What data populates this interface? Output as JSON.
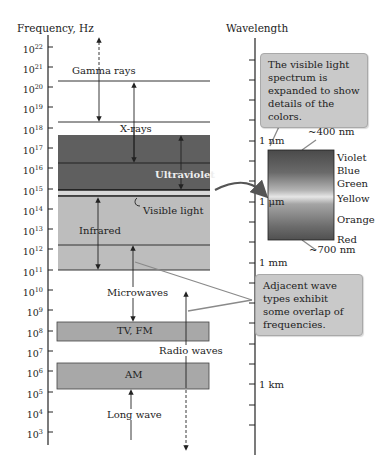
{
  "figure": {
    "freq_axis_title": "Frequency, Hz",
    "wavelength_axis_title": "Wavelength",
    "freq_ticks": [
      {
        "base": "10",
        "exp": "22"
      },
      {
        "base": "10",
        "exp": "21"
      },
      {
        "base": "10",
        "exp": "20"
      },
      {
        "base": "10",
        "exp": "19"
      },
      {
        "base": "10",
        "exp": "18"
      },
      {
        "base": "10",
        "exp": "17"
      },
      {
        "base": "10",
        "exp": "16"
      },
      {
        "base": "10",
        "exp": "15"
      },
      {
        "base": "10",
        "exp": "14"
      },
      {
        "base": "10",
        "exp": "13"
      },
      {
        "base": "10",
        "exp": "12"
      },
      {
        "base": "10",
        "exp": "11"
      },
      {
        "base": "10",
        "exp": "10"
      },
      {
        "base": "10",
        "exp": "9"
      },
      {
        "base": "10",
        "exp": "8"
      },
      {
        "base": "10",
        "exp": "7"
      },
      {
        "base": "10",
        "exp": "6"
      },
      {
        "base": "10",
        "exp": "5"
      },
      {
        "base": "10",
        "exp": "4"
      },
      {
        "base": "10",
        "exp": "3"
      }
    ],
    "wavelength_labels": {
      "pm": "1 pm",
      "nm": "1 nm",
      "um": "1 μm",
      "mm": "1 mm",
      "cm": "1 cm",
      "m": "1 m",
      "km": "1 km"
    },
    "bands": {
      "gamma": "Gamma rays",
      "xrays": "X-rays",
      "ultraviolet": "Ultraviolet",
      "visible": "Visible light",
      "infrared": "Infrared",
      "microwaves": "Microwaves",
      "tvfm": "TV, FM",
      "radio": "Radio waves",
      "am": "AM",
      "longwave": "Long wave"
    },
    "callouts": {
      "visible_expanded": "The visible light spectrum is expanded to show details of the colors.",
      "overlap": "Adjacent wave types exhibit some overlap of frequencies."
    },
    "spectrum": {
      "top_label": "~400 nm",
      "bottom_label": "~700 nm",
      "colors": [
        "Violet",
        "Blue",
        "Green",
        "Yellow",
        "Orange",
        "Red"
      ]
    },
    "colors": {
      "uv_band": "#5f5f5f",
      "ir_band": "#bdbdbd",
      "radio_band": "#a8a8a8",
      "visible_band": "#d8d8d8",
      "callout_bg": "#c9c9c9",
      "arrow": "#555555"
    }
  }
}
